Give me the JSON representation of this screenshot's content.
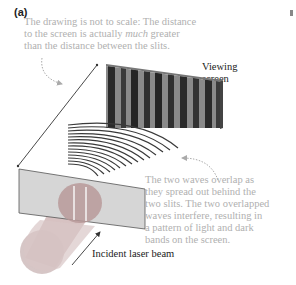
{
  "panel_label": "(a)",
  "annotations": {
    "scale_note": {
      "line1": "The drawing is not to scale: The distance",
      "line2_pre": "to the screen is actually ",
      "line2_em": "much",
      "line2_post": " greater",
      "line3": "than the distance between the slits."
    },
    "overlap_note": {
      "line1": "The two waves overlap as",
      "line2": "they spread out behind the",
      "line3": "two slits. The two overlapped",
      "line4": "waves interfere, resulting in",
      "line5": "a pattern of light and dark",
      "line6": "bands on the screen."
    }
  },
  "labels": {
    "viewing_screen_line1": "Viewing",
    "viewing_screen_line2": "screen",
    "incident_beam": "Incident laser beam"
  },
  "colors": {
    "note_text": "#b0b0b0",
    "label_text": "#222222",
    "barrier_plate": "#d4d4d4",
    "laser_beam": "#c9a6a6",
    "screen_dark": "#2a2a2a",
    "screen_light": "#8a8a8a",
    "wavefronts": "#3a3a3a"
  }
}
